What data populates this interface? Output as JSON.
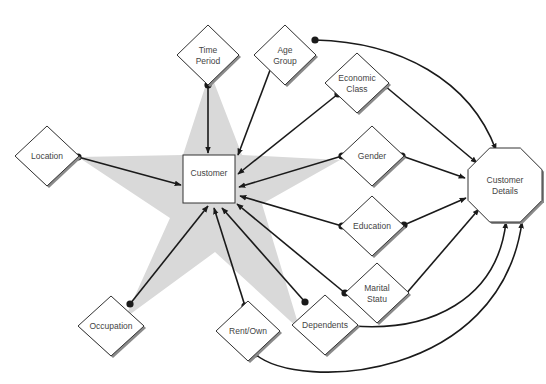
{
  "diagram": {
    "colors": {
      "star": "#d9d9d9",
      "line": "#1a1a1a",
      "node_stroke": "#333333",
      "shadow": "#8a8a8a",
      "text": "#444444"
    },
    "center": {
      "id": "customer",
      "label": "Customer",
      "shape": "rectangle"
    },
    "target": {
      "id": "customer-details",
      "label_lines": [
        "Customer",
        "Details"
      ],
      "shape": "octagon"
    },
    "attributes": [
      {
        "id": "time-period",
        "label_lines": [
          "Time",
          "Period"
        ]
      },
      {
        "id": "age-group",
        "label_lines": [
          "Age",
          "Group"
        ]
      },
      {
        "id": "economic-class",
        "label_lines": [
          "Economic",
          "Class"
        ]
      },
      {
        "id": "location",
        "label_lines": [
          "Location"
        ]
      },
      {
        "id": "gender",
        "label_lines": [
          "Gender"
        ]
      },
      {
        "id": "education",
        "label_lines": [
          "Education"
        ]
      },
      {
        "id": "marital-status",
        "label_lines": [
          "Marital",
          "Statu"
        ]
      },
      {
        "id": "occupation",
        "label_lines": [
          "Occupation"
        ]
      },
      {
        "id": "rent-own",
        "label_lines": [
          "Rent/Own"
        ]
      },
      {
        "id": "dependents",
        "label_lines": [
          "Dependents"
        ]
      }
    ],
    "edges_to_customer": [
      "time-period",
      "age-group",
      "economic-class",
      "location",
      "gender",
      "education",
      "marital-status",
      "occupation",
      "rent-own",
      "dependents"
    ],
    "edges_to_details": [
      "age-group",
      "economic-class",
      "gender",
      "education",
      "marital-status",
      "dependents",
      "rent-own"
    ]
  }
}
